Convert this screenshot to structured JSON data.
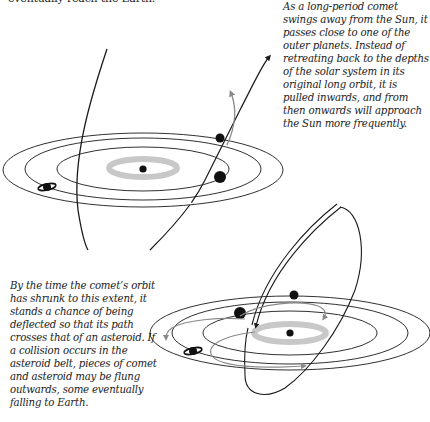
{
  "captions": {
    "top_fragment": "eventually reach the Earth.",
    "right": "As a long-period comet swings away from the Sun, it passes close to one of the outer planets. Instead of retreating back to the depths of the solar system in its original long orbit, it is pulled inwards, and from then onwards will approach the Sun more frequently.",
    "left": "By the time the comet’s orbit has shrunk to this extent, it stands a chance of being deflected so that its path crosses that of an asteroid. If a collision occurs in the asteroid belt, pieces of comet and asteroid may be flung outwards, some eventually falling to Earth."
  },
  "diagrams": [
    {
      "name": "long-period-comet-deflection",
      "elements": [
        "sun",
        "asteroid-belt",
        "planet-orbits",
        "jupiter",
        "saturn",
        "outer-planet",
        "long-period-comet-orbit",
        "deflected-comet-path"
      ]
    },
    {
      "name": "short-period-comet-asteroid-collision",
      "elements": [
        "sun",
        "asteroid-belt",
        "planet-orbits",
        "planets",
        "saturn",
        "short-period-comet-orbit",
        "fragment-paths"
      ]
    }
  ],
  "colors": {
    "line": "#1a1a1a",
    "asteroid_belt": "#c8c8c8",
    "deflected_path": "#8a8a8a",
    "text": "#222222"
  }
}
